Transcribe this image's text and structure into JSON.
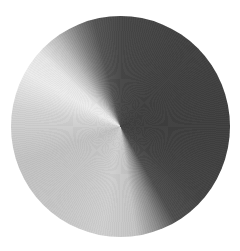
{
  "image": {
    "subject": "brushed-metal conical gradient disc",
    "background_color": "#ffffff",
    "disc": {
      "center": [
        120,
        126
      ],
      "diameter": 219,
      "dark_color": "#414141",
      "light_color": "#c8c8c8",
      "highlight_color": "#ececec"
    }
  }
}
